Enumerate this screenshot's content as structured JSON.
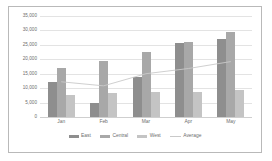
{
  "chart_data": {
    "type": "bar",
    "title": "",
    "subtitle": "",
    "xlabel": "",
    "ylabel": "",
    "categories": [
      "Jan",
      "Feb",
      "Mar",
      "Apr",
      "May"
    ],
    "ylim": [
      0,
      35000
    ],
    "ytick_step": 5000,
    "ytick_labels": [
      "35,000",
      "30,000",
      "25,000",
      "20,000",
      "15,000",
      "10,000",
      "5,000",
      "0"
    ],
    "ytick_values": [
      35000,
      30000,
      25000,
      20000,
      15000,
      10000,
      5000,
      0
    ],
    "grid": true,
    "legend_position": "bottom",
    "series": [
      {
        "name": "East",
        "kind": "bar",
        "color": "#8e8e8e",
        "values": [
          12000,
          4800,
          14000,
          25500,
          27000
        ]
      },
      {
        "name": "Central",
        "kind": "bar",
        "color": "#a8a8a8",
        "values": [
          17000,
          19500,
          22500,
          26000,
          29500
        ]
      },
      {
        "name": "West",
        "kind": "bar",
        "color": "#c4c4c4",
        "values": [
          7600,
          8200,
          8500,
          8600,
          9200
        ]
      },
      {
        "name": "Average",
        "kind": "line",
        "color": "#c9c9c9",
        "values": [
          12200,
          10800,
          15000,
          16800,
          19200
        ]
      }
    ]
  },
  "legend": {
    "items": [
      {
        "label": "East"
      },
      {
        "label": "Central"
      },
      {
        "label": "West"
      },
      {
        "label": "Average"
      }
    ]
  }
}
